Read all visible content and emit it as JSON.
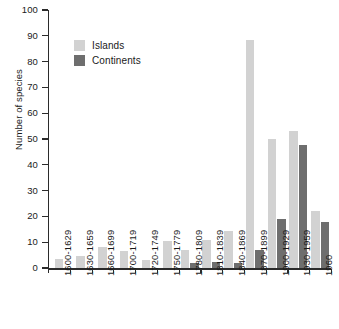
{
  "chart_data": {
    "type": "bar",
    "title": "",
    "subtitle": "",
    "xlabel": "",
    "ylabel": "Number of species",
    "ylim": [
      0,
      100
    ],
    "ytick_step": 10,
    "yticks": [
      0,
      10,
      20,
      30,
      40,
      50,
      60,
      70,
      80,
      90,
      100
    ],
    "grid": false,
    "legend_position": "top-left-inside",
    "categories": [
      "1600-1629",
      "1630-1659",
      "1660-1699",
      "1700-1719",
      "1720-1749",
      "1750-1779",
      "1780-1809",
      "1810-1839",
      "1840-1869",
      "1870-1899",
      "1900-1929",
      "1930-1959",
      "1960"
    ],
    "series": [
      {
        "name": "Islands",
        "color": "#d2d2d2",
        "values": [
          3.5,
          4.5,
          8,
          6.5,
          3,
          10.5,
          7,
          11,
          14.5,
          88.5,
          50,
          53,
          22
        ]
      },
      {
        "name": "Continents",
        "color": "#6e6e6e",
        "values": [
          0,
          0,
          0,
          0,
          0,
          0,
          2,
          2.5,
          2,
          7,
          19,
          47.5,
          18
        ]
      }
    ]
  },
  "legend": {
    "items": [
      {
        "label": "Islands",
        "color": "#d2d2d2"
      },
      {
        "label": "Continents",
        "color": "#6e6e6e"
      }
    ]
  },
  "axis": {
    "y_title": "Number of species"
  }
}
